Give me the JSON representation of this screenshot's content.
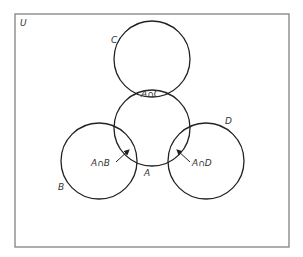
{
  "diagram": {
    "type": "venn",
    "universe": {
      "label": "U",
      "x": 15,
      "y": 14,
      "width": 274,
      "height": 233,
      "stroke": "#777777"
    },
    "circles": [
      {
        "id": "C",
        "label": "C",
        "cx": 152,
        "cy": 59,
        "r": 38,
        "label_x": 111,
        "label_y": 43
      },
      {
        "id": "A",
        "label": "A",
        "cx": 152,
        "cy": 128,
        "r": 38,
        "label_x": 144,
        "label_y": 176
      },
      {
        "id": "B",
        "label": "B",
        "cx": 99,
        "cy": 161,
        "r": 38,
        "label_x": 58,
        "label_y": 190
      },
      {
        "id": "D",
        "label": "D",
        "cx": 206,
        "cy": 161,
        "r": 38,
        "label_x": 225,
        "label_y": 124
      }
    ],
    "regions": [
      {
        "id": "A_and_C",
        "label": "A∩C",
        "x": 141,
        "y": 97
      },
      {
        "id": "A_and_B",
        "label": "A∩B",
        "x": 91,
        "y": 166
      },
      {
        "id": "A_and_D",
        "label": "A∩D",
        "x": 192,
        "y": 166
      }
    ],
    "arrows": [
      {
        "from": "A_and_B",
        "x1": 116,
        "y1": 162,
        "x2": 129,
        "y2": 150
      },
      {
        "from": "A_and_D",
        "x1": 190,
        "y1": 162,
        "x2": 177,
        "y2": 150
      }
    ],
    "line_color": "#222222"
  }
}
